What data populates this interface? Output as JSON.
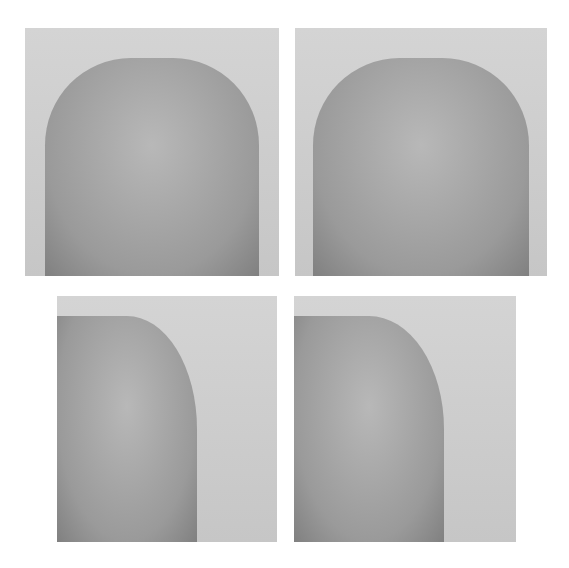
{
  "figure": {
    "panels": [
      {
        "id": "top-left",
        "view": "frontal",
        "stage": "before"
      },
      {
        "id": "top-right",
        "view": "frontal",
        "stage": "after"
      },
      {
        "id": "bottom-left",
        "view": "lateral",
        "stage": "before"
      },
      {
        "id": "bottom-right",
        "view": "lateral",
        "stage": "after"
      }
    ]
  }
}
